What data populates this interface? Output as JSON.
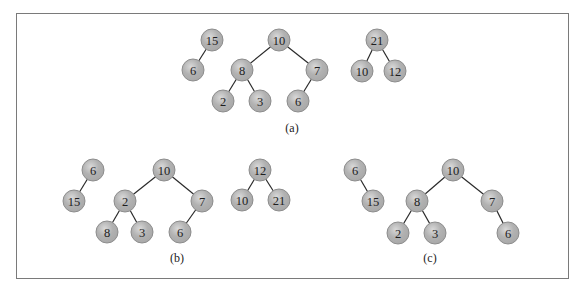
{
  "figure": {
    "border_color": "#7a7a7a",
    "node_fill_color": "#a9a9a9",
    "node_highlight_color": "#d9d9d9",
    "edge_color": "#2a2a2a",
    "node_radius": 11
  },
  "panels": [
    {
      "id": "a",
      "caption": "(a)",
      "caption_pos": [
        292,
        128
      ],
      "trees": [
        {
          "nodes": [
            {
              "id": "a1",
              "label": "15",
              "x": 212,
              "y": 40
            },
            {
              "id": "a2",
              "label": "6",
              "x": 193,
              "y": 70
            }
          ],
          "edges": [
            [
              "a1",
              "a2"
            ]
          ]
        },
        {
          "nodes": [
            {
              "id": "a3",
              "label": "10",
              "x": 279,
              "y": 40
            },
            {
              "id": "a4",
              "label": "8",
              "x": 242,
              "y": 70
            },
            {
              "id": "a5",
              "label": "7",
              "x": 317,
              "y": 70
            },
            {
              "id": "a6",
              "label": "2",
              "x": 223,
              "y": 101
            },
            {
              "id": "a7",
              "label": "3",
              "x": 260,
              "y": 101
            },
            {
              "id": "a8",
              "label": "6",
              "x": 298,
              "y": 101
            }
          ],
          "edges": [
            [
              "a3",
              "a4"
            ],
            [
              "a3",
              "a5"
            ],
            [
              "a4",
              "a6"
            ],
            [
              "a4",
              "a7"
            ],
            [
              "a5",
              "a8"
            ]
          ]
        },
        {
          "nodes": [
            {
              "id": "a9",
              "label": "21",
              "x": 377,
              "y": 40
            },
            {
              "id": "a10",
              "label": "10",
              "x": 362,
              "y": 71
            },
            {
              "id": "a11",
              "label": "12",
              "x": 395,
              "y": 71
            }
          ],
          "edges": [
            [
              "a9",
              "a10"
            ],
            [
              "a9",
              "a11"
            ]
          ]
        }
      ]
    },
    {
      "id": "b",
      "caption": "(b)",
      "caption_pos": [
        177,
        258
      ],
      "trees": [
        {
          "nodes": [
            {
              "id": "b1",
              "label": "6",
              "x": 93,
              "y": 170
            },
            {
              "id": "b2",
              "label": "15",
              "x": 74,
              "y": 201
            }
          ],
          "edges": [
            [
              "b1",
              "b2"
            ]
          ]
        },
        {
          "nodes": [
            {
              "id": "b3",
              "label": "10",
              "x": 164,
              "y": 170
            },
            {
              "id": "b4",
              "label": "2",
              "x": 125,
              "y": 201
            },
            {
              "id": "b5",
              "label": "7",
              "x": 202,
              "y": 201
            },
            {
              "id": "b6",
              "label": "8",
              "x": 107,
              "y": 232
            },
            {
              "id": "b7",
              "label": "3",
              "x": 142,
              "y": 232
            },
            {
              "id": "b8",
              "label": "6",
              "x": 180,
              "y": 232
            }
          ],
          "edges": [
            [
              "b3",
              "b4"
            ],
            [
              "b3",
              "b5"
            ],
            [
              "b4",
              "b6"
            ],
            [
              "b4",
              "b7"
            ],
            [
              "b5",
              "b8"
            ]
          ]
        },
        {
          "nodes": [
            {
              "id": "b9",
              "label": "12",
              "x": 260,
              "y": 170
            },
            {
              "id": "b10",
              "label": "10",
              "x": 242,
              "y": 200
            },
            {
              "id": "b11",
              "label": "21",
              "x": 279,
              "y": 200
            }
          ],
          "edges": [
            [
              "b9",
              "b10"
            ],
            [
              "b9",
              "b11"
            ]
          ]
        }
      ]
    },
    {
      "id": "c",
      "caption": "(c)",
      "caption_pos": [
        430,
        258
      ],
      "trees": [
        {
          "nodes": [
            {
              "id": "c1",
              "label": "6",
              "x": 355,
              "y": 170
            },
            {
              "id": "c2",
              "label": "15",
              "x": 373,
              "y": 201
            }
          ],
          "edges": [
            [
              "c1",
              "c2"
            ]
          ]
        },
        {
          "nodes": [
            {
              "id": "c3",
              "label": "10",
              "x": 453,
              "y": 170
            },
            {
              "id": "c4",
              "label": "8",
              "x": 417,
              "y": 201
            },
            {
              "id": "c5",
              "label": "7",
              "x": 492,
              "y": 201
            },
            {
              "id": "c6",
              "label": "2",
              "x": 398,
              "y": 233
            },
            {
              "id": "c7",
              "label": "3",
              "x": 435,
              "y": 233
            },
            {
              "id": "c8",
              "label": "6",
              "x": 508,
              "y": 233
            }
          ],
          "edges": [
            [
              "c3",
              "c4"
            ],
            [
              "c3",
              "c5"
            ],
            [
              "c4",
              "c6"
            ],
            [
              "c4",
              "c7"
            ],
            [
              "c5",
              "c8"
            ]
          ]
        }
      ]
    }
  ]
}
